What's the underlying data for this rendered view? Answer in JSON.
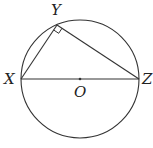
{
  "diagram": {
    "type": "geometry",
    "circle": {
      "cx": 80,
      "cy": 79,
      "r": 59
    },
    "points": {
      "X": {
        "label": "X",
        "x": 21,
        "y": 79
      },
      "Y": {
        "label": "Y",
        "x": 57,
        "y": 25
      },
      "Z": {
        "label": "Z",
        "x": 139,
        "y": 79
      },
      "O": {
        "label": "O",
        "x": 80,
        "y": 79
      }
    },
    "right_angle_at": "Y",
    "stroke_color": "#333333"
  }
}
